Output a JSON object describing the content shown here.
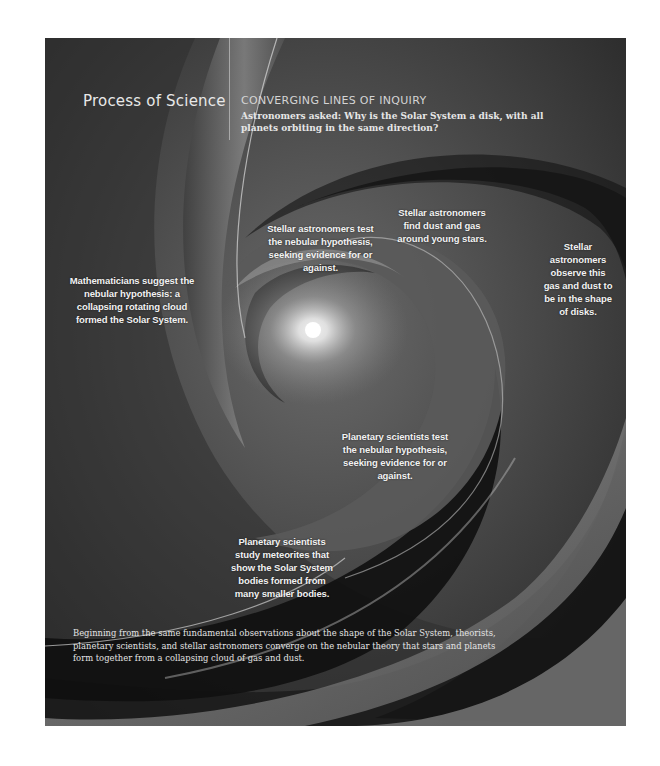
{
  "header": {
    "title": "Process of Science",
    "subtitle": "CONVERGING LINES OF INQUIRY",
    "question": "Astronomers asked: Why is the Solar System a disk, with all planets orbiting in the same direction?"
  },
  "callouts": [
    {
      "id": "mathematicians",
      "text": "Mathematicians suggest the nebular hypothesis: a collapsing rotating cloud formed the Solar System."
    },
    {
      "id": "stellar-test",
      "text": "Stellar astronomers test the nebular hypothesis, seeking evidence for or against."
    },
    {
      "id": "stellar-find",
      "text": "Stellar astronomers find dust and gas around young stars."
    },
    {
      "id": "stellar-observe",
      "text": "Stellar astronomers observe this gas and dust to be in the shape of disks."
    },
    {
      "id": "planetary-test",
      "text": "Planetary scientists test the nebular hypothesis, seeking evidence for or against."
    },
    {
      "id": "planetary-meteorites",
      "text": "Planetary scientists study meteorites that show the Solar System bodies formed from many smaller bodies."
    }
  ],
  "summary": "Beginning from the same fundamental observations about the shape of the Solar System, theorists, planetary scientists, and stellar astronomers converge on the nebular theory that stars and planets form together from a collapsing cloud of gas and dust.",
  "colors": {
    "background": "#3a3a3a",
    "dark_arm": "#141414",
    "light_arm": "#8c8c8c",
    "glow": "#ffffff",
    "text": "#f2f2f2"
  },
  "icons": {
    "central-star": "glow"
  }
}
